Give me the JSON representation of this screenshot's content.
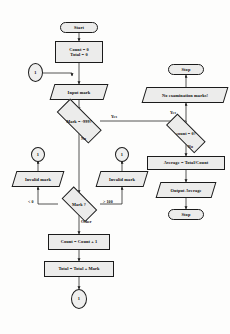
{
  "diagram": {
    "nodes": {
      "start": {
        "label": "Start"
      },
      "init": {
        "line1": "Count = 0",
        "line2": "Total = 0"
      },
      "connector_left": {
        "label": "1"
      },
      "input_mark": {
        "label": "Input mark"
      },
      "decision_sentinel": {
        "label": "Mark = -999?"
      },
      "decision_range": {
        "label": "Mark ?"
      },
      "connector_low": {
        "label": "1"
      },
      "invalid_left": {
        "label": "Invalid mark"
      },
      "connector_mid": {
        "label": "1"
      },
      "invalid_right": {
        "label": "Invalid mark"
      },
      "count_inc": {
        "label": "Count = Count + 1"
      },
      "total_add": {
        "label": "Total = Total + Mark"
      },
      "connector_bottom": {
        "label": "1"
      },
      "decision_count": {
        "label": "count = 0?"
      },
      "no_marks": {
        "label": "No examination marks!"
      },
      "stop_top": {
        "label": "Stop"
      },
      "average": {
        "label": "Average = Total/Count"
      },
      "output_average": {
        "label": "Output Average"
      },
      "stop_bottom": {
        "label": "Stop"
      }
    },
    "edge_labels": {
      "sentinel_yes": "Yes",
      "sentinel_no": "No",
      "range_low": "< 0",
      "range_high": "> 100",
      "range_other": "Other",
      "count_yes": "Yes",
      "count_no": "No"
    },
    "colors": {
      "stroke": "#1b1b1b",
      "fill": "#ececeb",
      "text": "#0d0d0d",
      "background": "#fdfdfc"
    }
  }
}
